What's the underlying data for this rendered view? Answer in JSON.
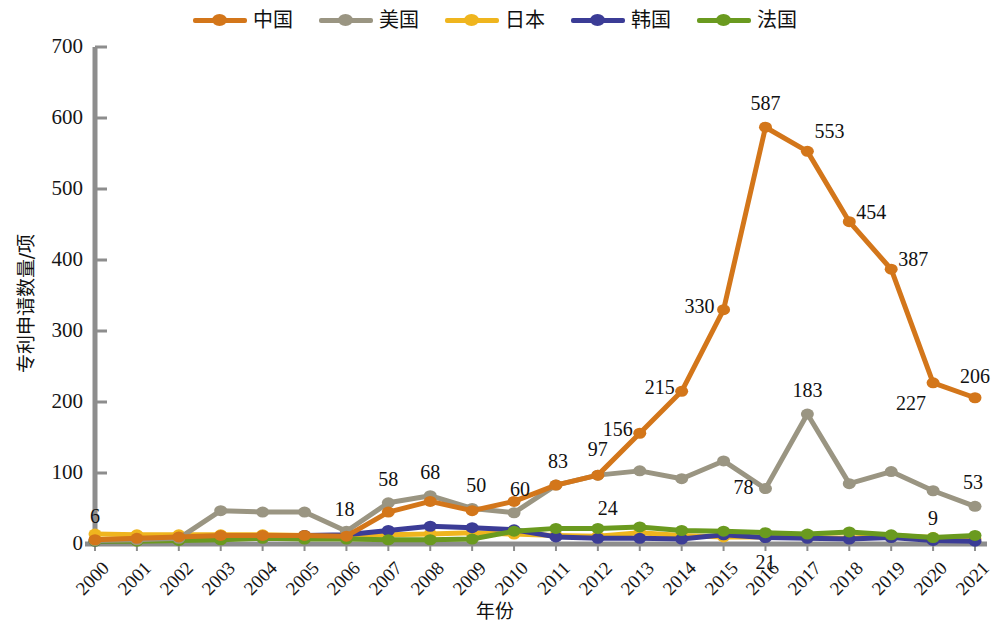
{
  "chart_data": {
    "type": "line",
    "title": "",
    "xlabel": "年份",
    "ylabel": "专利申请数量/项",
    "ylim": [
      0,
      700
    ],
    "yticks": [
      0,
      100,
      200,
      300,
      400,
      500,
      600,
      700
    ],
    "grid": false,
    "legend_position": "top-center",
    "categories": [
      "2000",
      "2001",
      "2002",
      "2003",
      "2004",
      "2005",
      "2006",
      "2007",
      "2008",
      "2009",
      "2010",
      "2011",
      "2012",
      "2013",
      "2014",
      "2015",
      "2016",
      "2017",
      "2018",
      "2019",
      "2020",
      "2021"
    ],
    "series": [
      {
        "name": "中国",
        "color": "#D3761A",
        "values": [
          6,
          8,
          10,
          12,
          12,
          12,
          11,
          45,
          60,
          47,
          60,
          83,
          97,
          156,
          215,
          330,
          587,
          553,
          454,
          387,
          227,
          206
        ]
      },
      {
        "name": "美国",
        "color": "#9A9582",
        "values": [
          5,
          6,
          8,
          47,
          45,
          45,
          18,
          58,
          68,
          50,
          44,
          83,
          97,
          103,
          92,
          117,
          78,
          183,
          85,
          102,
          75,
          53
        ]
      },
      {
        "name": "日本",
        "color": "#EFB51E",
        "values": [
          14,
          13,
          13,
          13,
          13,
          12,
          12,
          13,
          14,
          16,
          14,
          12,
          11,
          16,
          12,
          10,
          10,
          9,
          8,
          12,
          9,
          7
        ]
      },
      {
        "name": "韩国",
        "color": "#3B3C96",
        "values": [
          4,
          5,
          6,
          7,
          9,
          12,
          13,
          19,
          25,
          23,
          20,
          10,
          8,
          8,
          7,
          13,
          9,
          8,
          7,
          9,
          5,
          4
        ]
      },
      {
        "name": "法国",
        "color": "#6A9A1F",
        "values": [
          4,
          4,
          5,
          6,
          8,
          7,
          7,
          6,
          6,
          7,
          18,
          22,
          22,
          24,
          19,
          18,
          16,
          14,
          17,
          13,
          9,
          12
        ]
      }
    ],
    "point_labels": [
      {
        "series": "中国",
        "x": "2000",
        "value": 6,
        "text": "6",
        "dx": 0,
        "dy": -34
      },
      {
        "series": "美国",
        "x": "2006",
        "value": 18,
        "text": "18",
        "dx": -2,
        "dy": -32
      },
      {
        "series": "美国",
        "x": "2007",
        "value": 58,
        "text": "58",
        "dx": 0,
        "dy": -34
      },
      {
        "series": "美国",
        "x": "2008",
        "value": 68,
        "text": "68",
        "dx": 0,
        "dy": -34
      },
      {
        "series": "美国",
        "x": "2009",
        "value": 50,
        "text": "50",
        "dx": 4,
        "dy": -34
      },
      {
        "series": "美国",
        "x": "2010",
        "value": 44,
        "text": "60",
        "dx": 6,
        "dy": -34
      },
      {
        "series": "美国",
        "x": "2011",
        "value": 83,
        "text": "83",
        "dx": 2,
        "dy": -34
      },
      {
        "series": "美国",
        "x": "2012",
        "value": 97,
        "text": "97",
        "dx": 0,
        "dy": -36
      },
      {
        "series": "法国",
        "x": "2012",
        "value": 22,
        "text": "24",
        "dx": 10,
        "dy": -30
      },
      {
        "series": "中国",
        "x": "2013",
        "value": 156,
        "text": "156",
        "dx": -22,
        "dy": -14
      },
      {
        "series": "中国",
        "x": "2014",
        "value": 215,
        "text": "215",
        "dx": -22,
        "dy": -14
      },
      {
        "series": "中国",
        "x": "2015",
        "value": 330,
        "text": "330",
        "dx": -24,
        "dy": -14
      },
      {
        "series": "中国",
        "x": "2016",
        "value": 587,
        "text": "587",
        "dx": 0,
        "dy": -34
      },
      {
        "series": "美国",
        "x": "2016",
        "value": 78,
        "text": "78",
        "dx": -22,
        "dy": -12
      },
      {
        "series": "韩国",
        "x": "2016",
        "value": 9,
        "text": "21",
        "dx": 0,
        "dy": 14
      },
      {
        "series": "中国",
        "x": "2017",
        "value": 553,
        "text": "553",
        "dx": 22,
        "dy": -30
      },
      {
        "series": "美国",
        "x": "2017",
        "value": 183,
        "text": "183",
        "dx": 0,
        "dy": -34
      },
      {
        "series": "中国",
        "x": "2018",
        "value": 454,
        "text": "454",
        "dx": 22,
        "dy": -20
      },
      {
        "series": "中国",
        "x": "2019",
        "value": 387,
        "text": "387",
        "dx": 22,
        "dy": -20
      },
      {
        "series": "中国",
        "x": "2020",
        "value": 227,
        "text": "227",
        "dx": -22,
        "dy": 10
      },
      {
        "series": "法国",
        "x": "2020",
        "value": 9,
        "text": "9",
        "dx": 0,
        "dy": -30
      },
      {
        "series": "中国",
        "x": "2021",
        "value": 206,
        "text": "206",
        "dx": 0,
        "dy": -32
      },
      {
        "series": "美国",
        "x": "2021",
        "value": 53,
        "text": "53",
        "dx": -2,
        "dy": -34
      }
    ]
  },
  "legend": {
    "items": [
      {
        "label": "中国",
        "color": "#D3761A"
      },
      {
        "label": "美国",
        "color": "#9A9582"
      },
      {
        "label": "日本",
        "color": "#EFB51E"
      },
      {
        "label": "韩国",
        "color": "#3B3C96"
      },
      {
        "label": "法国",
        "color": "#6A9A1F"
      }
    ]
  },
  "axis": {
    "y_title": "专利申请数量/项",
    "x_title": "年份",
    "axis_color": "#8d8d8d"
  }
}
